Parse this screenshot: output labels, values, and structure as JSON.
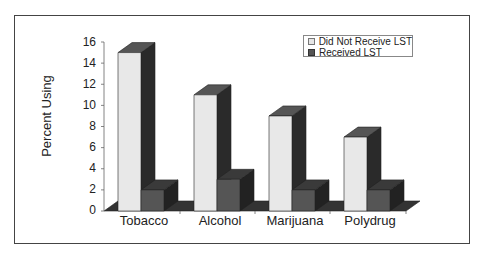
{
  "chart_data": {
    "type": "bar",
    "style": "3d-clustered-column",
    "title": "",
    "xlabel": "",
    "ylabel": "Percent Using",
    "ylim": [
      0,
      16
    ],
    "yticks": [
      0,
      2,
      4,
      6,
      8,
      10,
      12,
      14,
      16
    ],
    "grid": false,
    "legend_position": "top-right",
    "categories": [
      "Tobacco",
      "Alcohol",
      "Marijuana",
      "Polydrug"
    ],
    "series": [
      {
        "name": "Did Not Receive LST",
        "color": "#e6e6e6",
        "values": [
          15,
          11,
          9,
          7
        ]
      },
      {
        "name": "Received LST",
        "color": "#555555",
        "values": [
          2,
          3,
          2,
          2
        ]
      }
    ]
  },
  "legend": {
    "items": [
      "Did Not Receive LST",
      "Received LST"
    ]
  },
  "axis": {
    "ylabel": "Percent Using",
    "ticks": [
      "0",
      "2",
      "4",
      "6",
      "8",
      "10",
      "12",
      "14",
      "16"
    ]
  },
  "categories": [
    "Tobacco",
    "Alcohol",
    "Marijuana",
    "Polydrug"
  ]
}
